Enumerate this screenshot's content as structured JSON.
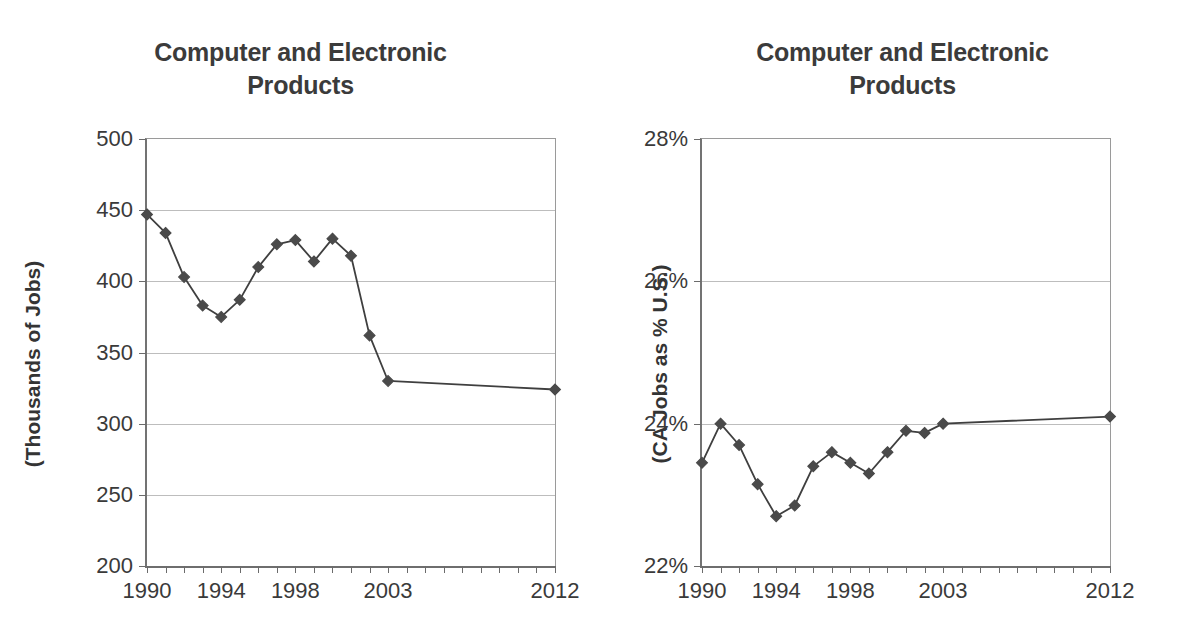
{
  "charts": [
    {
      "id": "jobs",
      "title_line1": "Computer and Electronic",
      "title_line2": "Products",
      "ylabel": "(Thousands of Jobs)",
      "ytick_labels": [
        "500",
        "450",
        "400",
        "350",
        "300",
        "250",
        "200"
      ],
      "xtick_labels": [
        "1990",
        "1994",
        "1998",
        "2003",
        "2012"
      ],
      "marker_color": "#4a4a4a",
      "line_color": "#3f3f3f",
      "grid_color": "#bdbdbd"
    },
    {
      "id": "share",
      "title_line1": "Computer and Electronic",
      "title_line2": "Products",
      "ylabel": "(CA Jobs as % U.S.)",
      "ytick_labels": [
        "28%",
        "26%",
        "24%",
        "22%"
      ],
      "xtick_labels": [
        "1990",
        "1994",
        "1998",
        "2003",
        "2012"
      ],
      "marker_color": "#4a4a4a",
      "line_color": "#3f3f3f",
      "grid_color": "#bdbdbd"
    }
  ],
  "chart_data": [
    {
      "type": "line",
      "id": "jobs",
      "title": "Computer and Electronic Products",
      "xlabel": "",
      "ylabel": "(Thousands of Jobs)",
      "ylim": [
        200,
        500
      ],
      "yticks": [
        200,
        250,
        300,
        350,
        400,
        450,
        500
      ],
      "ytick_labels": [
        "200",
        "250",
        "300",
        "350",
        "400",
        "450",
        "500"
      ],
      "xlim": [
        1990,
        2012
      ],
      "xticks": [
        1990,
        1991,
        1992,
        1993,
        1994,
        1995,
        1996,
        1997,
        1998,
        1999,
        2000,
        2001,
        2002,
        2003,
        2004,
        2005,
        2006,
        2007,
        2008,
        2009,
        2010,
        2011,
        2012
      ],
      "xtick_labels_shown": [
        "1990",
        "1994",
        "1998",
        "2003",
        "2012"
      ],
      "grid": "horizontal",
      "legend": "none",
      "marker": "diamond",
      "x": [
        1990,
        1991,
        1992,
        1993,
        1994,
        1995,
        1996,
        1997,
        1998,
        1999,
        2000,
        2001,
        2002,
        2003,
        2012
      ],
      "values": [
        447,
        434,
        403,
        383,
        375,
        387,
        410,
        426,
        429,
        414,
        430,
        418,
        362,
        330,
        324
      ],
      "units": "thousands of jobs"
    },
    {
      "type": "line",
      "id": "share",
      "title": "Computer and Electronic Products",
      "xlabel": "",
      "ylabel": "(CA Jobs as % U.S.)",
      "ylim": [
        22,
        28
      ],
      "yticks": [
        22,
        24,
        26,
        28
      ],
      "ytick_labels": [
        "22%",
        "24%",
        "26%",
        "28%"
      ],
      "xlim": [
        1990,
        2012
      ],
      "xticks": [
        1990,
        1991,
        1992,
        1993,
        1994,
        1995,
        1996,
        1997,
        1998,
        1999,
        2000,
        2001,
        2002,
        2003,
        2004,
        2005,
        2006,
        2007,
        2008,
        2009,
        2010,
        2011,
        2012
      ],
      "xtick_labels_shown": [
        "1990",
        "1994",
        "1998",
        "2003",
        "2012"
      ],
      "grid": "horizontal",
      "legend": "none",
      "marker": "diamond",
      "x": [
        1990,
        1991,
        1992,
        1993,
        1994,
        1995,
        1996,
        1997,
        1998,
        1999,
        2000,
        2001,
        2002,
        2003,
        2012
      ],
      "values": [
        23.45,
        24.0,
        23.7,
        23.15,
        22.7,
        22.85,
        23.4,
        23.6,
        23.45,
        23.3,
        23.6,
        23.9,
        23.87,
        24.0,
        24.1
      ],
      "units": "percent"
    }
  ]
}
